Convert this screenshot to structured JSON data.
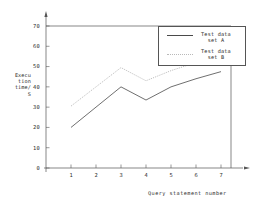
{
  "chart_data": {
    "type": "line",
    "title": "",
    "xlabel": "Query statement number",
    "ylabel": "Execu tion time/ S",
    "ylabel_lines": [
      "Execu",
      "tion",
      "time/",
      "S"
    ],
    "x": [
      1,
      2,
      3,
      4,
      5,
      6,
      7
    ],
    "categories": [
      "1",
      "2",
      "3",
      "4",
      "5",
      "6",
      "7"
    ],
    "xlim": [
      0,
      7.4
    ],
    "ylim": [
      0,
      73
    ],
    "yticks": [
      0,
      10,
      20,
      30,
      40,
      50,
      60,
      70
    ],
    "ytick_labels": [
      "0",
      "10",
      "20",
      "30",
      "40",
      "50",
      "60",
      "70"
    ],
    "xticks": [
      1,
      2,
      3,
      4,
      5,
      6,
      7
    ],
    "grid": false,
    "legend_position": "top-right",
    "series": [
      {
        "name": "Test data set A",
        "name_lines": [
          "Test data",
          "set A"
        ],
        "style": "solid",
        "color": "#4a4a4a",
        "values": [
          20,
          30,
          40,
          33.5,
          40,
          44,
          47.5
        ]
      },
      {
        "name": "Test data set B",
        "name_lines": [
          "Test data",
          "set B"
        ],
        "style": "dotted",
        "color": "#b9b9b9",
        "values": [
          30.5,
          40,
          49.5,
          43,
          48,
          52,
          55.5
        ]
      }
    ]
  },
  "axes": {
    "axis_color": "#555555",
    "top_rule_value": 70
  }
}
